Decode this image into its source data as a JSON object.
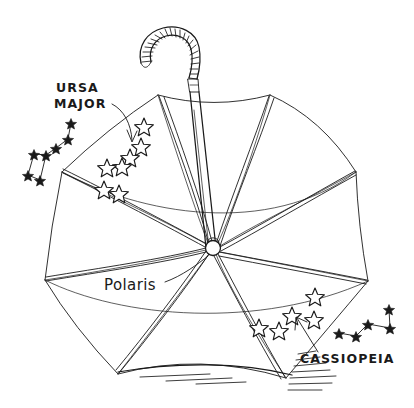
{
  "artwork": {
    "title": "Umbrella as night sky with constellations",
    "medium": "pen-and-ink line drawing",
    "background_color": "#ffffff",
    "ink_color": "#1a1a1a"
  },
  "labels": {
    "ursa_major": "URSA\nMAJOR",
    "ursa_major_line1": "URSA",
    "ursa_major_line2": "MAJOR",
    "polaris": "Polaris",
    "cassiopeia": "CASSIOPEIA"
  },
  "subject": {
    "object_name": "umbrella",
    "view": "open, seen from underneath",
    "panel_count": 8,
    "rib_count": 8,
    "handle_type": "crook",
    "hub_label": "Polaris"
  },
  "canopy_tips": [
    {
      "id": "tip-top-left",
      "x": 158,
      "y": 95
    },
    {
      "id": "tip-top-right",
      "x": 270,
      "y": 95
    },
    {
      "id": "tip-right-upper",
      "x": 356,
      "y": 172
    },
    {
      "id": "tip-right-lower",
      "x": 368,
      "y": 281
    },
    {
      "id": "tip-bottom-right",
      "x": 286,
      "y": 378
    },
    {
      "id": "tip-bottom-left",
      "x": 118,
      "y": 374
    },
    {
      "id": "tip-left-lower",
      "x": 45,
      "y": 280
    },
    {
      "id": "tip-left-upper",
      "x": 62,
      "y": 172
    }
  ],
  "hub": {
    "x": 213,
    "y": 248,
    "radius": 7
  },
  "canopy_stars": {
    "ursa_major_on_canopy": {
      "count": 7,
      "style": "open outline star",
      "points": [
        {
          "x": 144,
          "y": 125
        },
        {
          "x": 141,
          "y": 145
        },
        {
          "x": 130,
          "y": 156
        },
        {
          "x": 122,
          "y": 165
        },
        {
          "x": 107,
          "y": 166
        },
        {
          "x": 104,
          "y": 188
        },
        {
          "x": 119,
          "y": 192
        }
      ]
    },
    "cassiopeia_on_canopy": {
      "count": 5,
      "style": "open outline star",
      "points": [
        {
          "x": 259,
          "y": 326
        },
        {
          "x": 279,
          "y": 329
        },
        {
          "x": 292,
          "y": 314
        },
        {
          "x": 314,
          "y": 318
        },
        {
          "x": 315,
          "y": 295
        }
      ]
    }
  },
  "sky_constellations": [
    {
      "name": "URSA MAJOR",
      "common_name": "Big Dipper",
      "star_style": "small solid star",
      "star_count": 7,
      "side": "left",
      "stars": [
        {
          "id": "alkaid",
          "x": 71,
          "y": 123
        },
        {
          "id": "mizar",
          "x": 68,
          "y": 139
        },
        {
          "id": "alioth",
          "x": 56,
          "y": 148
        },
        {
          "id": "megrez",
          "x": 46,
          "y": 155
        },
        {
          "id": "dubhe",
          "x": 34,
          "y": 154
        },
        {
          "id": "merak",
          "x": 28,
          "y": 175
        },
        {
          "id": "phecda",
          "x": 40,
          "y": 180
        }
      ],
      "segments": [
        [
          0,
          1
        ],
        [
          1,
          2
        ],
        [
          2,
          3
        ],
        [
          3,
          4
        ],
        [
          4,
          5
        ],
        [
          5,
          6
        ],
        [
          6,
          3
        ]
      ]
    },
    {
      "name": "CASSIOPEIA",
      "common_name": "The W",
      "star_style": "small solid star",
      "star_count": 5,
      "side": "right",
      "stars": [
        {
          "id": "caph",
          "x": 339,
          "y": 333
        },
        {
          "id": "schedar",
          "x": 356,
          "y": 336
        },
        {
          "id": "gamma",
          "x": 368,
          "y": 324
        },
        {
          "id": "ruchbah",
          "x": 390,
          "y": 328
        },
        {
          "id": "segin",
          "x": 389,
          "y": 309
        }
      ],
      "segments": [
        [
          0,
          1
        ],
        [
          1,
          2
        ],
        [
          2,
          3
        ],
        [
          3,
          4
        ]
      ]
    }
  ],
  "annotations": [
    {
      "id": "ursa-major-arrow",
      "label": "URSA MAJOR",
      "from": {
        "x": 112,
        "y": 104
      },
      "to": {
        "x": 131,
        "y": 141
      },
      "type": "curved-arrow"
    },
    {
      "id": "polaris-leader",
      "label": "Polaris",
      "from": {
        "x": 165,
        "y": 282
      },
      "to": {
        "x": 209,
        "y": 256
      },
      "type": "leader-line"
    },
    {
      "id": "cassiopeia-arrow",
      "label": "CASSIOPEIA",
      "from": {
        "x": 316,
        "y": 350
      },
      "to": {
        "x": 296,
        "y": 318
      },
      "type": "straight-arrow"
    }
  ],
  "label_positions": {
    "ursa_major": {
      "x": 56,
      "y": 92
    },
    "polaris": {
      "x": 104,
      "y": 290
    },
    "cassiopeia": {
      "x": 300,
      "y": 363
    }
  },
  "ground": {
    "line_from": {
      "x": 118,
      "y": 372
    },
    "line_to": {
      "x": 292,
      "y": 375
    },
    "shading": "horizontal hatch strokes"
  }
}
